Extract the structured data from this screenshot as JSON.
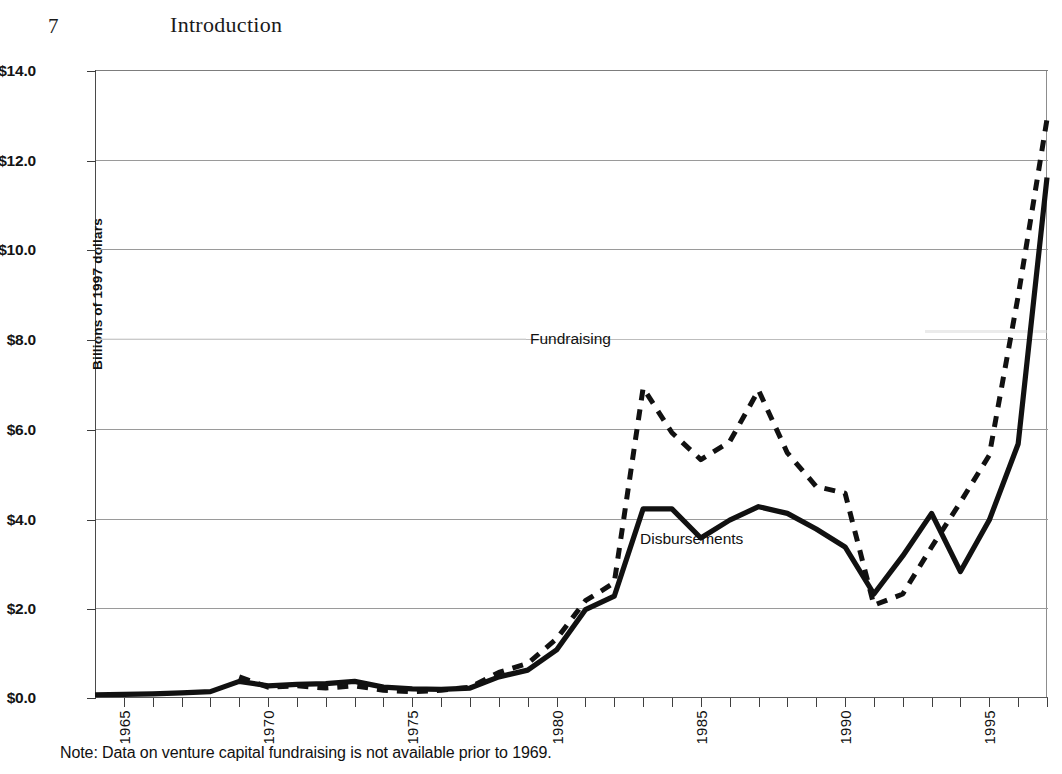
{
  "page": {
    "folio": "7",
    "running_head": "Introduction"
  },
  "figure": {
    "note": "Note: Data on venture capital fundraising is not available prior to 1969.",
    "yaxis_title": "Billions of 1997 dollars",
    "series_labels": {
      "fundraising": "Fundraising",
      "disbursements": "Disbursements"
    }
  },
  "chart_data": {
    "type": "line",
    "title": "",
    "xlabel": "",
    "ylabel": "Billions of 1997 dollars",
    "xlim": [
      1964,
      1997
    ],
    "ylim": [
      0,
      14
    ],
    "yticks": [
      0,
      2,
      4,
      6,
      8,
      10,
      12,
      14
    ],
    "ytick_labels": [
      "$0.0",
      "$2.0",
      "$4.0",
      "$6.0",
      "$8.0",
      "$10.0",
      "$12.0",
      "$14.0"
    ],
    "xticks": [
      1965,
      1970,
      1975,
      1980,
      1985,
      1990,
      1995
    ],
    "xtick_labels": [
      "1965",
      "1970",
      "1975",
      "1980",
      "1985",
      "1990",
      "1995"
    ],
    "xtick_minor_step": 1,
    "grid": "horizontal",
    "legend": "inline-annotation",
    "annotations": [
      {
        "text": "Fundraising",
        "x": 1982.0,
        "y": 8.05
      },
      {
        "text": "Disbursements",
        "x": 1985.8,
        "y": 3.75
      }
    ],
    "note": "Note: Data on venture capital fundraising is not available prior to 1969.",
    "x": [
      1964,
      1965,
      1966,
      1967,
      1968,
      1969,
      1970,
      1971,
      1972,
      1973,
      1974,
      1975,
      1976,
      1977,
      1978,
      1979,
      1980,
      1981,
      1982,
      1983,
      1984,
      1985,
      1986,
      1987,
      1988,
      1989,
      1990,
      1991,
      1992,
      1993,
      1994,
      1995,
      1996,
      1997
    ],
    "series": [
      {
        "name": "Disbursements",
        "style": "solid",
        "color": "#111111",
        "values": [
          0.05,
          0.06,
          0.07,
          0.09,
          0.12,
          0.35,
          0.25,
          0.28,
          0.3,
          0.35,
          0.22,
          0.18,
          0.17,
          0.2,
          0.45,
          0.6,
          1.05,
          1.95,
          2.25,
          4.2,
          4.2,
          3.55,
          3.95,
          4.25,
          4.1,
          3.75,
          3.35,
          2.3,
          3.15,
          4.1,
          2.8,
          3.95,
          5.65,
          11.6
        ]
      },
      {
        "name": "Fundraising",
        "style": "dashed",
        "color": "#111111",
        "values": [
          null,
          null,
          null,
          null,
          null,
          0.45,
          0.22,
          0.25,
          0.2,
          0.25,
          0.15,
          0.12,
          0.15,
          0.22,
          0.55,
          0.75,
          1.3,
          2.15,
          2.55,
          6.9,
          5.9,
          5.3,
          5.7,
          6.85,
          5.45,
          4.7,
          4.55,
          2.05,
          2.3,
          3.35,
          4.35,
          5.4,
          8.95,
          12.9
        ]
      }
    ]
  }
}
